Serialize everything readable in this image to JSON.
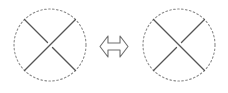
{
  "figure": {
    "background_color": "#ffffff",
    "equivalence_symbol": "⟺",
    "equivalence_symbol_name": "double-headed-arrow"
  },
  "chart_data": {
    "type": "diagram",
    "canvas": {
      "width": 228,
      "height": 93
    },
    "colors": {
      "strand": "#555555",
      "circle": "#8a8a8a",
      "arrow_stroke": "#6e6e6e",
      "arrow_fill": "#ffffff",
      "background": "#ffffff"
    },
    "style": {
      "circle_dash": "1.6 2.4",
      "circle_stroke_width": 1.1,
      "strand_stroke_width": 1.3,
      "break_gap_px": 7
    },
    "panels": [
      {
        "id": "left",
        "label": "left-tangle",
        "circle": {
          "cx": 50,
          "cy": 45,
          "r": 36
        },
        "strands": [
          {
            "name": "strand-nw-se",
            "from": {
              "x": 24.5,
              "y": 19.5
            },
            "to": {
              "x": 75.5,
              "y": 70.5
            },
            "crossing": "under",
            "broken_at_center": true
          },
          {
            "name": "strand-ne-sw",
            "from": {
              "x": 75.5,
              "y": 19.5
            },
            "to": {
              "x": 24.5,
              "y": 70.5
            },
            "crossing": "over",
            "broken_at_center": false
          }
        ]
      },
      {
        "id": "right",
        "label": "right-tangle",
        "circle": {
          "cx": 179,
          "cy": 45,
          "r": 36
        },
        "strands": [
          {
            "name": "strand-nw-se",
            "from": {
              "x": 153.5,
              "y": 19.5
            },
            "to": {
              "x": 204.5,
              "y": 70.5
            },
            "crossing": "over",
            "broken_at_center": false
          },
          {
            "name": "strand-ne-sw",
            "from": {
              "x": 204.5,
              "y": 19.5
            },
            "to": {
              "x": 153.5,
              "y": 70.5
            },
            "crossing": "under",
            "broken_at_center": true
          }
        ]
      }
    ],
    "connector": {
      "name": "equivalence-arrow",
      "symbol": "⟺",
      "direction": "bidirectional",
      "x": 100,
      "y": 36,
      "width": 28,
      "height": 21
    }
  }
}
